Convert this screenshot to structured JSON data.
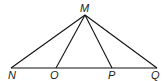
{
  "diagram": {
    "points": {
      "M": {
        "label": "M",
        "x": 85,
        "y": 15
      },
      "N": {
        "label": "N",
        "x": 11,
        "y": 68
      },
      "O": {
        "label": "O",
        "x": 56,
        "y": 68
      },
      "P": {
        "label": "P",
        "x": 112,
        "y": 68
      },
      "Q": {
        "label": "Q",
        "x": 157,
        "y": 68
      }
    },
    "segments": [
      "MN",
      "MO",
      "MP",
      "MQ",
      "NQ"
    ],
    "line_color": "#111111"
  }
}
